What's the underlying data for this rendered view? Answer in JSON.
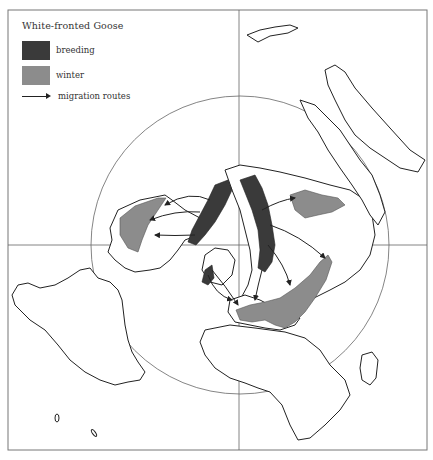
{
  "legend": {
    "title": "White-fronted Goose",
    "items": [
      {
        "label": "breeding",
        "color": "#3a3a3a"
      },
      {
        "label": "winter",
        "color": "#8c8c8c"
      },
      {
        "label": "migration routes",
        "symbol": "arrow"
      }
    ]
  },
  "map": {
    "projection": "polar azimuthal (north pole centered)",
    "circle": {
      "cx": 240,
      "cy": 245,
      "r": 149
    },
    "grid_lines": {
      "vertical_x": 239,
      "horizontal_y": 245
    },
    "colors": {
      "breeding": "#3a3a3a",
      "winter": "#8c8c8c",
      "land_outline": "#222222",
      "background": "#ffffff"
    }
  }
}
